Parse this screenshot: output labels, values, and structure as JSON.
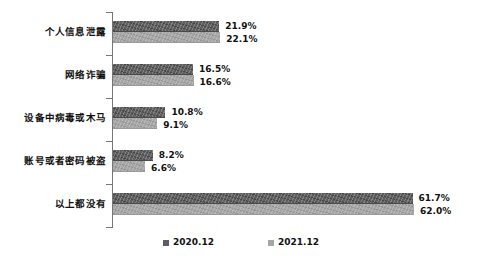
{
  "chart_data": {
    "type": "bar",
    "orientation": "horizontal",
    "title": "",
    "subtitle": "",
    "xlabel": "",
    "ylabel": "",
    "grid": false,
    "legend_position": "bottom",
    "xlim": [
      0,
      70
    ],
    "categories": [
      "个人信息泄露",
      "网络诈骗",
      "设备中病毒或木马",
      "账号或者密码被盗",
      "以上都没有"
    ],
    "series": [
      {
        "name": "2020.12",
        "color": "#5e5e5e",
        "values": [
          21.9,
          16.5,
          10.8,
          8.2,
          61.7
        ],
        "labels": [
          "21.9%",
          "16.5%",
          "10.8%",
          "8.2%",
          "61.7%"
        ]
      },
      {
        "name": "2021.12",
        "color": "#a6a6a6",
        "values": [
          22.1,
          16.6,
          9.1,
          6.6,
          62.0
        ],
        "labels": [
          "22.1%",
          "16.6%",
          "9.1%",
          "6.6%",
          "62.0%"
        ]
      }
    ]
  },
  "legend": {
    "items": [
      {
        "label": "2020.12"
      },
      {
        "label": "2021.12"
      }
    ]
  },
  "colors": {
    "series_2020": "#5e5e5e",
    "series_2021": "#a6a6a6",
    "axis": "#767676",
    "text": "#111111",
    "background": "#ffffff"
  }
}
